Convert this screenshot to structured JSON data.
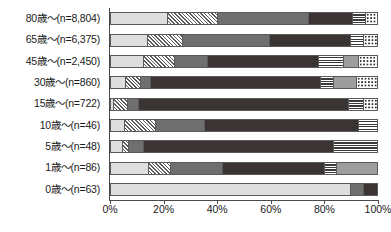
{
  "chart_data": {
    "type": "bar",
    "orientation": "horizontal",
    "stacked": true,
    "normalized": true,
    "title": "",
    "xlabel": "",
    "ylabel": "",
    "xlim": [
      0,
      100
    ],
    "xticks": [
      0,
      20,
      40,
      60,
      80,
      100
    ],
    "xticklabels": [
      "0%",
      "20%",
      "40%",
      "60%",
      "80%",
      "100%"
    ],
    "grid": false,
    "legend": "none",
    "categories": [
      "80歳～(n=8,804)",
      "65歳～(n=6,375)",
      "45歳～(n=2,450)",
      "30歳～(n=860)",
      "15歳～(n=722)",
      "10歳～(n=46)",
      "5歳～(n=48)",
      "1歳～(n=86)",
      "0歳～(n=63)"
    ],
    "series": [
      {
        "name": "series-1",
        "pattern": "light",
        "values": [
          21.6,
          13.8,
          12.3,
          5.6,
          1.1,
          5.2,
          4.5,
          14.2,
          90.3
        ]
      },
      {
        "name": "series-2",
        "pattern": "hatch",
        "values": [
          18.7,
          13.4,
          11.9,
          5.6,
          5.2,
          11.6,
          2.2,
          8.2,
          0.0
        ]
      },
      {
        "name": "series-3",
        "pattern": "medium",
        "values": [
          34.3,
          32.5,
          12.3,
          3.7,
          4.1,
          18.7,
          5.6,
          19.8,
          4.9
        ]
      },
      {
        "name": "series-4",
        "pattern": "dark",
        "values": [
          16.4,
          30.6,
          41.8,
          64.2,
          79.1,
          57.8,
          71.6,
          38.1,
          4.8
        ]
      },
      {
        "name": "series-5",
        "pattern": "hstripe",
        "values": [
          4.9,
          4.9,
          9.3,
          4.9,
          5.6,
          6.7,
          16.1,
          4.5,
          0.0
        ]
      },
      {
        "name": "series-6",
        "pattern": "gray",
        "values": [
          0.0,
          0.0,
          5.6,
          8.6,
          0.0,
          0.0,
          0.0,
          15.2,
          0.0
        ]
      },
      {
        "name": "series-7",
        "pattern": "dots",
        "values": [
          4.1,
          4.8,
          6.8,
          7.4,
          4.9,
          0.0,
          0.0,
          0.0,
          0.0
        ]
      }
    ]
  },
  "axis": {
    "tick_labels": [
      "0%",
      "20%",
      "40%",
      "60%",
      "80%",
      "100%"
    ]
  }
}
